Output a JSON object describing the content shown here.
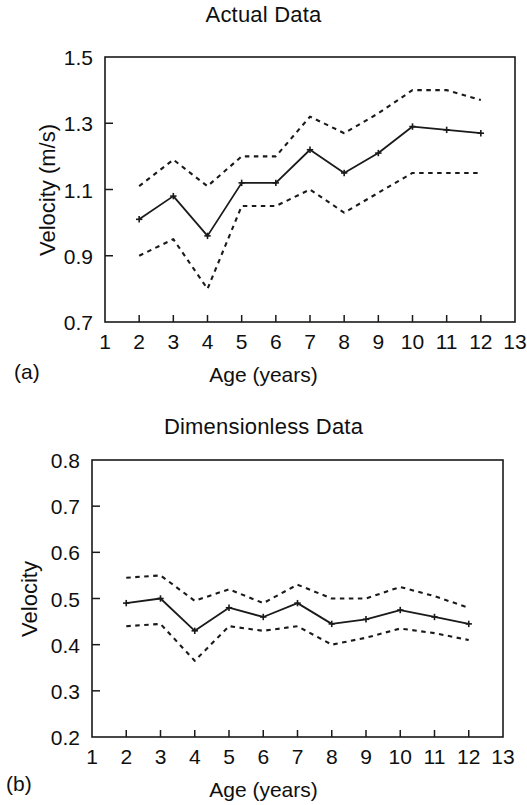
{
  "figure": {
    "panel_a_label": "(a)",
    "panel_b_label": "(b)"
  },
  "chart_data": [
    {
      "id": "actual-data",
      "type": "line",
      "title": "Actual Data",
      "xlabel": "Age (years)",
      "ylabel": "Velocity (m/s)",
      "xlim": [
        1,
        13
      ],
      "ylim": [
        0.7,
        1.5
      ],
      "xticks": [
        1,
        2,
        3,
        4,
        5,
        6,
        7,
        8,
        9,
        10,
        11,
        12,
        13
      ],
      "xticklabels": [
        "1",
        "2",
        "3",
        "4",
        "5",
        "6",
        "7",
        "8",
        "9",
        "10",
        "11",
        "12",
        "13"
      ],
      "yticks": [
        0.7,
        0.9,
        1.1,
        1.3,
        1.5
      ],
      "yticklabels": [
        "0.7",
        "0.9",
        "1.1",
        "1.3",
        "1.5"
      ],
      "grid": false,
      "legend": "none",
      "x": [
        2,
        3,
        4,
        5,
        6,
        7,
        8,
        9,
        10,
        11,
        12
      ],
      "series": [
        {
          "name": "Mean",
          "style": "solid-with-markers",
          "values": [
            1.01,
            1.08,
            0.96,
            1.12,
            1.12,
            1.22,
            1.15,
            1.21,
            1.29,
            1.28,
            1.27
          ]
        },
        {
          "name": "Upper bound",
          "style": "dotted",
          "values": [
            1.11,
            1.19,
            1.11,
            1.2,
            1.2,
            1.32,
            1.27,
            1.33,
            1.4,
            1.4,
            1.37
          ]
        },
        {
          "name": "Lower bound",
          "style": "dotted",
          "values": [
            0.9,
            0.95,
            0.8,
            1.05,
            1.05,
            1.1,
            1.03,
            1.09,
            1.15,
            1.15,
            1.15
          ]
        }
      ]
    },
    {
      "id": "dimensionless-data",
      "type": "line",
      "title": "Dimensionless Data",
      "xlabel": "Age (years)",
      "ylabel": "Velocity",
      "xlim": [
        1,
        13
      ],
      "ylim": [
        0.2,
        0.8
      ],
      "xticks": [
        1,
        2,
        3,
        4,
        5,
        6,
        7,
        8,
        9,
        10,
        11,
        12,
        13
      ],
      "xticklabels": [
        "1",
        "2",
        "3",
        "4",
        "5",
        "6",
        "7",
        "8",
        "9",
        "10",
        "11",
        "12",
        "13"
      ],
      "yticks": [
        0.2,
        0.3,
        0.4,
        0.5,
        0.6,
        0.7,
        0.8
      ],
      "yticklabels": [
        "0.2",
        "0.3",
        "0.4",
        "0.5",
        "0.6",
        "0.7",
        "0.8"
      ],
      "grid": false,
      "legend": "none",
      "x": [
        2,
        3,
        4,
        5,
        6,
        7,
        8,
        9,
        10,
        11,
        12
      ],
      "series": [
        {
          "name": "Mean",
          "style": "solid-with-markers",
          "values": [
            0.49,
            0.5,
            0.43,
            0.48,
            0.46,
            0.49,
            0.445,
            0.455,
            0.475,
            0.46,
            0.445
          ]
        },
        {
          "name": "Upper bound",
          "style": "dotted",
          "values": [
            0.545,
            0.55,
            0.495,
            0.52,
            0.49,
            0.53,
            0.5,
            0.5,
            0.525,
            0.505,
            0.48
          ]
        },
        {
          "name": "Lower bound",
          "style": "dotted",
          "values": [
            0.44,
            0.445,
            0.365,
            0.44,
            0.43,
            0.44,
            0.4,
            0.415,
            0.435,
            0.425,
            0.41
          ]
        }
      ]
    }
  ]
}
